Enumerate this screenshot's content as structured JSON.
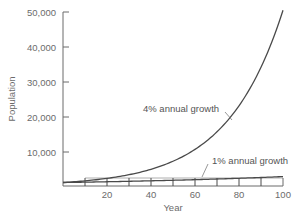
{
  "chart_data": {
    "type": "line",
    "title": "",
    "xlabel": "Year",
    "ylabel": "Population",
    "xlim": [
      0,
      100
    ],
    "ylim": [
      0,
      50000
    ],
    "x_ticks": [
      20,
      40,
      60,
      80,
      100
    ],
    "x_minor_ticks": [
      10,
      20,
      30,
      40,
      50,
      60,
      70,
      80,
      90,
      100
    ],
    "y_ticks": [
      10000,
      20000,
      30000,
      40000,
      50000
    ],
    "y_tick_labels": [
      "10,000",
      "20,000",
      "30,000",
      "40,000",
      "50,000"
    ],
    "x_tick_labels": [
      "20",
      "40",
      "60",
      "80",
      "100"
    ],
    "grid": false,
    "legend": "none (inline annotations)",
    "x": [
      0,
      10,
      20,
      30,
      40,
      50,
      60,
      70,
      80,
      90,
      100
    ],
    "series": [
      {
        "name": "4% annual growth",
        "values": [
          1000,
          1480,
          2191,
          3243,
          4801,
          7107,
          10520,
          15572,
          23050,
          34119,
          50505
        ]
      },
      {
        "name": "1% annual growth",
        "values": [
          1000,
          1105,
          1220,
          1348,
          1489,
          1645,
          1817,
          2007,
          2217,
          2449,
          2705
        ]
      }
    ],
    "annotations": [
      {
        "text": "4% annual growth",
        "points_to": "4% series near year 72"
      },
      {
        "text": "1% annual growth",
        "points_to": "1% series near year 63"
      }
    ]
  },
  "labels": {
    "y_axis": "Population",
    "x_axis": "Year",
    "annot_4": "4% annual growth",
    "annot_1": "1% annual growth",
    "y_ticks": [
      "50,000",
      "40,000",
      "30,000",
      "20,000",
      "10,000"
    ],
    "x_ticks": [
      "20",
      "40",
      "60",
      "80",
      "100"
    ]
  },
  "colors": {
    "line": "#4a4a4a",
    "axis": "#6b6b6b",
    "text": "#6b6b6b"
  }
}
